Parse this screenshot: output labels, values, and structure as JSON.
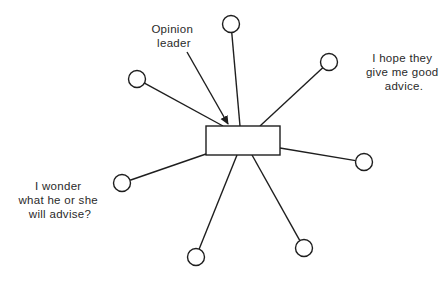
{
  "diagram": {
    "type": "network-star",
    "colors": {
      "stroke": "#1e1e1e",
      "text": "#2a2a2a",
      "background": "#ffffff"
    },
    "center": {
      "name": "opinion-leader",
      "shape": "rectangle",
      "x": 206,
      "y": 126,
      "width": 74,
      "height": 29
    },
    "nodes": [
      {
        "id": "top-left",
        "cx": 137,
        "cy": 79,
        "r": 8.5,
        "attach": [
          223,
          126
        ]
      },
      {
        "id": "top",
        "cx": 231,
        "cy": 24,
        "r": 8.5,
        "attach": [
          240,
          126
        ]
      },
      {
        "id": "upper-right",
        "cx": 329,
        "cy": 62,
        "r": 8.5,
        "attach": [
          260,
          126
        ]
      },
      {
        "id": "right",
        "cx": 364,
        "cy": 162,
        "r": 8.5,
        "attach": [
          280,
          148
        ]
      },
      {
        "id": "lower-right",
        "cx": 304,
        "cy": 248,
        "r": 8.5,
        "attach": [
          252,
          155
        ]
      },
      {
        "id": "bottom",
        "cx": 196,
        "cy": 257,
        "r": 8.5,
        "attach": [
          237,
          155
        ]
      },
      {
        "id": "left",
        "cx": 122,
        "cy": 183,
        "r": 8.5,
        "attach": [
          206,
          154
        ]
      }
    ],
    "arrow": {
      "from": [
        187,
        52
      ],
      "to": [
        228,
        124
      ]
    },
    "labels": {
      "opinion_leader": {
        "lines": [
          "Opinion",
          "leader"
        ],
        "x": 174,
        "y": [
          33,
          47
        ]
      },
      "hope": {
        "lines": [
          "I hope they",
          "give me good",
          "advice."
        ],
        "x": 404,
        "y": [
          62,
          76,
          90
        ]
      },
      "wonder": {
        "lines": [
          "I wonder",
          "what he or she",
          "will advise?"
        ],
        "x": 60,
        "y": [
          190,
          204,
          218
        ]
      }
    }
  }
}
